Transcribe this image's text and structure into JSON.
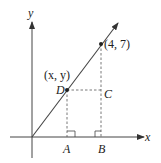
{
  "diagram": {
    "axes": {
      "x_label": "x",
      "y_label": "y"
    },
    "points": {
      "upper": {
        "label": "(4, 7)"
      },
      "D": {
        "name": "D",
        "coord_label": "(x, y)"
      },
      "C": {
        "name": "C"
      },
      "A": {
        "name": "A"
      },
      "B": {
        "name": "B"
      }
    },
    "colors": {
      "line": "#444444",
      "dashed": "#555555",
      "text": "#222222"
    }
  }
}
